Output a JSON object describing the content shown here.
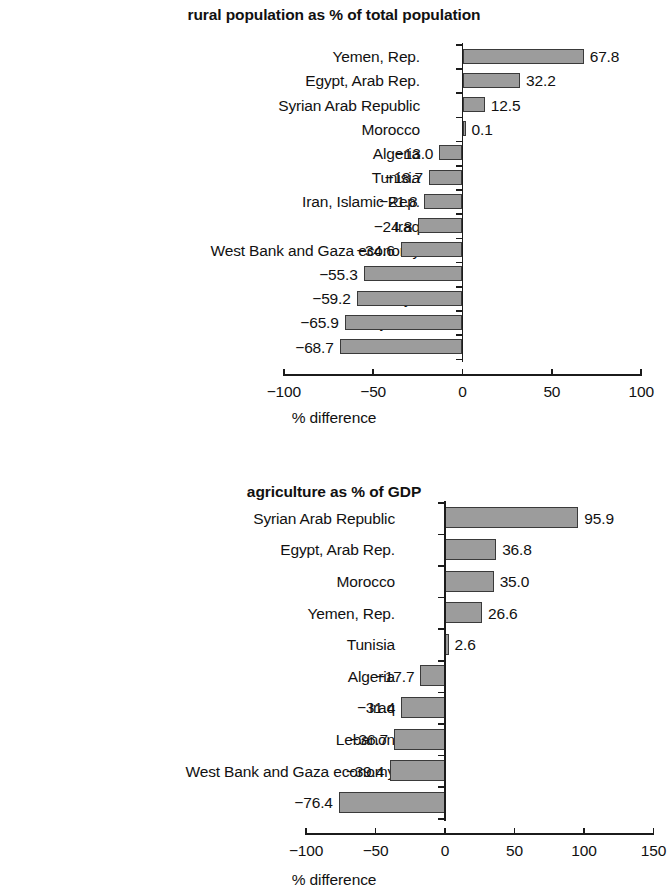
{
  "chart_data": [
    {
      "type": "bar",
      "orientation": "horizontal",
      "title": "rural population as % of total population",
      "xlabel": "% difference",
      "ylabel": "",
      "xlim": [
        -100,
        100
      ],
      "xticks": [
        -100,
        -50,
        0,
        50,
        100
      ],
      "xtick_labels": [
        "−100",
        "−50",
        "0",
        "50",
        "100"
      ],
      "grid": false,
      "legend": null,
      "categories": [
        "Yemen, Rep.",
        "Egypt, Arab Rep.",
        "Syrian Arab Republic",
        "Morocco",
        "Algeria",
        "Tunisia",
        "Iran, Islamic Rep.",
        "Iraq",
        "West Bank and Gaza economy",
        "Jordan",
        "Libya",
        "Djibouti",
        "Lebanon"
      ],
      "values": [
        67.8,
        32.2,
        12.5,
        0.1,
        -13.0,
        -18.7,
        -21.8,
        -24.8,
        -34.6,
        -55.3,
        -59.2,
        -65.9,
        -68.7
      ],
      "value_labels": [
        "67.8",
        "32.2",
        "12.5",
        "0.1",
        "−13.0",
        "−18.7",
        "−21.8",
        "−24.8",
        "−34.6",
        "−55.3",
        "−59.2",
        "−65.9",
        "−68.7"
      ]
    },
    {
      "type": "bar",
      "orientation": "horizontal",
      "title": "agriculture as % of GDP",
      "xlabel": "% difference",
      "ylabel": "",
      "xlim": [
        -100,
        150
      ],
      "xticks": [
        -100,
        -50,
        0,
        50,
        100,
        150
      ],
      "xtick_labels": [
        "−100",
        "−50",
        "0",
        "50",
        "100",
        "150"
      ],
      "grid": false,
      "legend": null,
      "categories": [
        "Syrian Arab Republic",
        "Egypt, Arab Rep.",
        "Morocco",
        "Yemen, Rep.",
        "Tunisia",
        "Algeria",
        "Iraq",
        "Lebanon",
        "West Bank and Gaza economy",
        "Jordan"
      ],
      "values": [
        95.9,
        36.8,
        35.0,
        26.6,
        2.6,
        -17.7,
        -31.4,
        -36.7,
        -39.4,
        -76.4
      ],
      "value_labels": [
        "95.9",
        "36.8",
        "35.0",
        "26.6",
        "2.6",
        "−17.7",
        "−31.4",
        "−36.7",
        "−39.4",
        "−76.4"
      ]
    }
  ],
  "style": {
    "bar_fill": "#9c9c9c",
    "bar_stroke": "#3a3a3a",
    "axis_color": "#1b1b1b",
    "text_color": "#111111",
    "background": "#ffffff"
  }
}
